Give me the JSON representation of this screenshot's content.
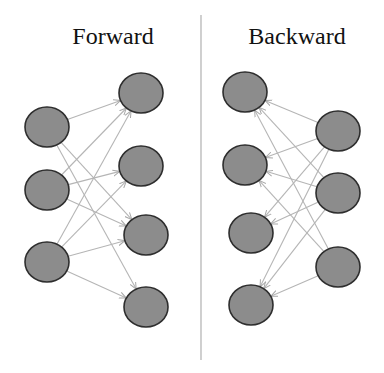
{
  "panels": {
    "forward": {
      "title": "Forward",
      "layers": {
        "input": [
          {
            "id": "f_in_1",
            "cx": 47,
            "cy": 127
          },
          {
            "id": "f_in_2",
            "cx": 47,
            "cy": 190
          },
          {
            "id": "f_in_3",
            "cx": 47,
            "cy": 262
          }
        ],
        "output": [
          {
            "id": "f_out_1",
            "cx": 141,
            "cy": 93
          },
          {
            "id": "f_out_2",
            "cx": 141,
            "cy": 166
          },
          {
            "id": "f_out_3",
            "cx": 146,
            "cy": 235
          },
          {
            "id": "f_out_4",
            "cx": 146,
            "cy": 307
          }
        ]
      },
      "edges": [
        [
          "f_in_1",
          "f_out_1"
        ],
        [
          "f_in_1",
          "f_out_3"
        ],
        [
          "f_in_1",
          "f_out_4"
        ],
        [
          "f_in_2",
          "f_out_1"
        ],
        [
          "f_in_2",
          "f_out_2"
        ],
        [
          "f_in_2",
          "f_out_3"
        ],
        [
          "f_in_3",
          "f_out_1"
        ],
        [
          "f_in_3",
          "f_out_2"
        ],
        [
          "f_in_3",
          "f_out_3"
        ],
        [
          "f_in_3",
          "f_out_4"
        ]
      ]
    },
    "backward": {
      "title": "Backward",
      "layers": {
        "left": [
          {
            "id": "b_l_1",
            "cx": 245,
            "cy": 92
          },
          {
            "id": "b_l_2",
            "cx": 245,
            "cy": 165
          },
          {
            "id": "b_l_3",
            "cx": 251,
            "cy": 233
          },
          {
            "id": "b_l_4",
            "cx": 251,
            "cy": 305
          }
        ],
        "right": [
          {
            "id": "b_r_1",
            "cx": 338,
            "cy": 131
          },
          {
            "id": "b_r_2",
            "cx": 338,
            "cy": 193
          },
          {
            "id": "b_r_3",
            "cx": 338,
            "cy": 267
          }
        ]
      },
      "edges": [
        [
          "b_r_1",
          "b_l_1"
        ],
        [
          "b_r_1",
          "b_l_2"
        ],
        [
          "b_r_1",
          "b_l_3"
        ],
        [
          "b_r_1",
          "b_l_4"
        ],
        [
          "b_r_2",
          "b_l_1"
        ],
        [
          "b_r_2",
          "b_l_2"
        ],
        [
          "b_r_2",
          "b_l_3"
        ],
        [
          "b_r_2",
          "b_l_4"
        ],
        [
          "b_r_3",
          "b_l_1"
        ],
        [
          "b_r_3",
          "b_l_2"
        ],
        [
          "b_r_3",
          "b_l_4"
        ]
      ]
    }
  },
  "style": {
    "node_fill": "#8c8c8c",
    "node_stroke": "#2e2e2e",
    "edge_color": "#b5b5b5",
    "divider_color": "#b0b0b0"
  },
  "divider": {
    "x": 201,
    "y1": 15,
    "y2": 360
  },
  "node_radius": {
    "rx": 22,
    "ry": 20
  }
}
